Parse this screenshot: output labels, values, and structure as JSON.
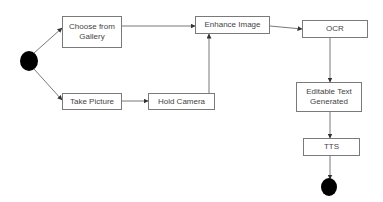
{
  "diagram": {
    "type": "flowchart",
    "start": {
      "label": "start-node"
    },
    "end": {
      "label": "end-node"
    },
    "nodes": [
      {
        "id": "gallery",
        "label": "Choose from\nGallery"
      },
      {
        "id": "take",
        "label": "Take Picture"
      },
      {
        "id": "hold",
        "label": "Hold Camera"
      },
      {
        "id": "enhance",
        "label": "Enhance Image"
      },
      {
        "id": "ocr",
        "label": "OCR"
      },
      {
        "id": "editable",
        "label": "Editable Text\nGenerated"
      },
      {
        "id": "tts",
        "label": "TTS"
      }
    ],
    "edges": [
      {
        "from": "start",
        "to": "gallery"
      },
      {
        "from": "start",
        "to": "take"
      },
      {
        "from": "gallery",
        "to": "enhance"
      },
      {
        "from": "take",
        "to": "hold"
      },
      {
        "from": "hold",
        "to": "enhance"
      },
      {
        "from": "enhance",
        "to": "ocr"
      },
      {
        "from": "ocr",
        "to": "editable"
      },
      {
        "from": "editable",
        "to": "tts"
      },
      {
        "from": "tts",
        "to": "end"
      }
    ],
    "colors": {
      "line": "#555555",
      "border": "#7a7a7a",
      "text": "#444444",
      "terminal": "#000000"
    }
  }
}
